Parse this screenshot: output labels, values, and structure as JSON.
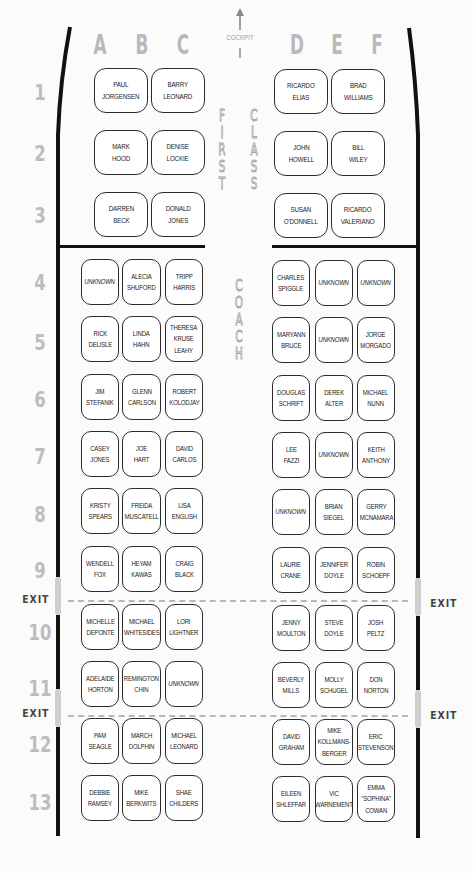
{
  "header": {
    "columns": [
      "A",
      "B",
      "C",
      "D",
      "E",
      "F"
    ],
    "cockpit_label": "COCKPIT",
    "cockpit_icon": "arrow-up-icon"
  },
  "sections": {
    "first_class_label": [
      "F",
      "I",
      "R",
      "S",
      "T"
    ],
    "first_class_label2": [
      "C",
      "L",
      "A",
      "S",
      "S"
    ],
    "coach_label": [
      "C",
      "O",
      "A",
      "C",
      "H"
    ]
  },
  "rows": [
    "1",
    "2",
    "3",
    "4",
    "5",
    "6",
    "7",
    "8",
    "9",
    "10",
    "11",
    "12",
    "13"
  ],
  "exits": {
    "label": "EXIT",
    "after_rows": [
      "9",
      "11"
    ]
  },
  "first_class": [
    {
      "row": "1",
      "seats": [
        "PAUL\nJORGENSEN",
        "BARRY\nLEONARD",
        "RICARDO\nELIAS",
        "BRAD\nWILLIAMS"
      ]
    },
    {
      "row": "2",
      "seats": [
        "MARK\nHOOD",
        "DENISE\nLOCKIE",
        "JOHN\nHOWELL",
        "BILL\nWILEY"
      ]
    },
    {
      "row": "3",
      "seats": [
        "DARREN\nBECK",
        "DONALD\nJONES",
        "SUSAN\nO'DONNELL",
        "RICARDO\nVALERIANO"
      ]
    }
  ],
  "coach": [
    {
      "row": "4",
      "seats": [
        "UNKNOWN",
        "ALECIA\nSHUFORD",
        "TRIPP\nHARRIS",
        "CHARLES\nSPIGGLE",
        "UNKNOWN",
        "UNKNOWN"
      ]
    },
    {
      "row": "5",
      "seats": [
        "RICK\nDELISLE",
        "LINDA\nHAHN",
        "THERESA\nKRUSE\nLEAHY",
        "MARYANN\nBRUCE",
        "UNKNOWN",
        "JORGE\nMORGADO"
      ]
    },
    {
      "row": "6",
      "seats": [
        "JIM\nSTEFANIK",
        "GLENN\nCARLSON",
        "ROBERT\nKOLODJAY",
        "DOUGLAS\nSCHRIFT",
        "DEREK\nALTER",
        "MICHAEL\nNUNN"
      ]
    },
    {
      "row": "7",
      "seats": [
        "CASEY\nJONES",
        "JOE\nHART",
        "DAVID\nCARLOS",
        "LEE\nFAZZI",
        "UNKNOWN",
        "KEITH\nANTHONY"
      ]
    },
    {
      "row": "8",
      "seats": [
        "KRISTY\nSPEARS",
        "FREIDA\nMUSCATELL",
        "LISA\nENGLISH",
        "UNKNOWN",
        "BRIAN\nSIEGEL",
        "GERRY\nMCNAMARA"
      ]
    },
    {
      "row": "9",
      "seats": [
        "WENDELL\nFOX",
        "HEYAM\nKAWAS",
        "CRAIG\nBLACK",
        "LAURIE\nCRANE",
        "JENNIFER\nDOYLE",
        "ROBIN\nSCHOEPF"
      ]
    },
    {
      "row": "10",
      "seats": [
        "MICHELLE\nDEPONTE",
        "MICHAEL\nWHITESIDES",
        "LORI\nLIGHTNER",
        "JENNY\nMOULTON",
        "STEVE\nDOYLE",
        "JOSH\nPELTZ"
      ]
    },
    {
      "row": "11",
      "seats": [
        "ADELAIDE\nHORTON",
        "REMINGTON\nCHIN",
        "UNKNOWN",
        "BEVERLY\nMILLS",
        "MOLLY\nSCHUGEL",
        "DON\nNORTON"
      ]
    },
    {
      "row": "12",
      "seats": [
        "PAM\nSEAGLE",
        "MARCH\nDOLPHIN",
        "MICHAEL\nLEONARD",
        "DAVID\nGRAHAM",
        "MIKE\nKOLLMANS-\nBERGER",
        "ERIC\nSTEVENSON"
      ]
    },
    {
      "row": "13",
      "seats": [
        "DEBBIE\nRAMSEY",
        "MIKE\nBERKWITS",
        "SHAE\nCHILDERS",
        "EILEEN\nSHLEFFAR",
        "VIC\nWARNEMENT",
        "EMMA\n\"SOPHINA\"\nCOWAN"
      ]
    }
  ],
  "colors": {
    "wall": "#111111",
    "exit_gap": "#cfcfcf",
    "label_gray": "#b9b9b9",
    "seat_border": "#2b2b2b"
  }
}
